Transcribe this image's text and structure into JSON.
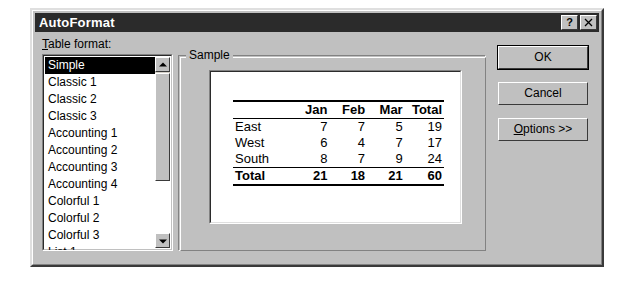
{
  "window": {
    "title": "AutoFormat",
    "help_button": "?",
    "close_button": "✕"
  },
  "left_panel": {
    "label_prefix": "T",
    "label_rest": "able format:",
    "list_items": [
      {
        "label": "Simple",
        "selected": true
      },
      {
        "label": "Classic 1",
        "selected": false
      },
      {
        "label": "Classic 2",
        "selected": false
      },
      {
        "label": "Classic 3",
        "selected": false
      },
      {
        "label": "Accounting 1",
        "selected": false
      },
      {
        "label": "Accounting 2",
        "selected": false
      },
      {
        "label": "Accounting 3",
        "selected": false
      },
      {
        "label": "Accounting 4",
        "selected": false
      },
      {
        "label": "Colorful 1",
        "selected": false
      },
      {
        "label": "Colorful 2",
        "selected": false
      },
      {
        "label": "Colorful 3",
        "selected": false
      },
      {
        "label": "List 1",
        "selected": false
      }
    ]
  },
  "sample_group": {
    "legend": "Sample",
    "table": {
      "corner": "",
      "columns": [
        "Jan",
        "Feb",
        "Mar",
        "Total"
      ],
      "rows": [
        {
          "label": "East",
          "values": [
            7,
            7,
            5,
            19
          ],
          "bold": false
        },
        {
          "label": "West",
          "values": [
            6,
            4,
            7,
            17
          ],
          "bold": false
        },
        {
          "label": "South",
          "values": [
            8,
            7,
            9,
            24
          ],
          "bold": false
        },
        {
          "label": "Total",
          "values": [
            21,
            18,
            21,
            60
          ],
          "bold": true
        }
      ]
    }
  },
  "buttons": {
    "ok": "OK",
    "cancel": "Cancel",
    "options_prefix": "O",
    "options_rest": "ptions >>"
  },
  "colors": {
    "dialog_face": "#c0c0c0",
    "titlebar": "#2b2b2b",
    "titlebar_text": "#ffffff",
    "selection": "#000000",
    "field_bg": "#ffffff"
  }
}
